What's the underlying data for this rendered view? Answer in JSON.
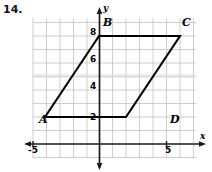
{
  "question": {
    "number": "14."
  },
  "axes": {
    "x_axis_label": "x",
    "y_axis_label": "y",
    "x_ticks": [
      {
        "value": -5,
        "label": "-5"
      },
      {
        "value": 5,
        "label": "5"
      }
    ],
    "y_ticks": [
      {
        "value": 8,
        "label": "8"
      },
      {
        "value": 6,
        "label": "6"
      },
      {
        "value": 4,
        "label": "4"
      },
      {
        "value": 2,
        "label": "2"
      }
    ]
  },
  "chart_data": {
    "type": "scatter",
    "title": "",
    "xlabel": "x",
    "ylabel": "y",
    "xlim": [
      -5,
      7.2
    ],
    "ylim": [
      -1.1,
      9.3
    ],
    "grid": true,
    "legend": "none",
    "unit_px": 13.5,
    "origin_px": {
      "x": 99,
      "y": 144
    },
    "grid_extent_px": {
      "left": 33,
      "right": 196,
      "top": 18,
      "bottom": 158
    },
    "shapes": [
      {
        "name": "parallelogram-ABCD",
        "closed": true,
        "vertices": [
          {
            "label": "A",
            "x": -4,
            "y": 2
          },
          {
            "label": "B",
            "x": 0,
            "y": 8
          },
          {
            "label": "C",
            "x": 6,
            "y": 8
          },
          {
            "label": "D",
            "x": 2,
            "y": 2
          }
        ]
      }
    ],
    "vertex_labels": [
      {
        "label": "A",
        "x": -4,
        "y": 2,
        "px": 39,
        "py": 114
      },
      {
        "label": "B",
        "x": 0,
        "y": 8,
        "px": 103,
        "py": 17
      },
      {
        "label": "C",
        "x": 6,
        "y": 8,
        "px": 182,
        "py": 17
      },
      {
        "label": "D",
        "x": 2,
        "y": 2,
        "px": 170,
        "py": 114
      }
    ]
  }
}
